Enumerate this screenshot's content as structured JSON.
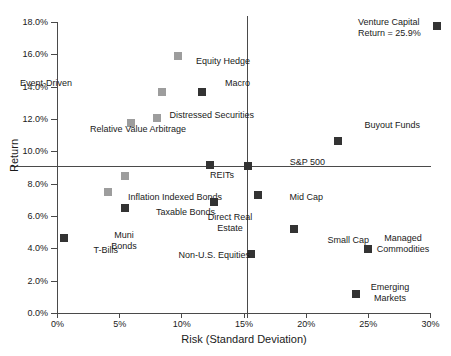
{
  "chart_data": {
    "type": "scatter",
    "title": "",
    "xlabel": "Risk (Standard Deviation)",
    "ylabel": "Return",
    "xlim": [
      0,
      30
    ],
    "ylim": [
      0,
      18
    ],
    "xticks": [
      "0%",
      "5%",
      "10%",
      "15%",
      "20%",
      "25%",
      "30%"
    ],
    "yticks": [
      "0.0%",
      "2.0%",
      "4.0%",
      "6.0%",
      "8.0%",
      "10.0%",
      "12.0%",
      "14.0%",
      "16.0%",
      "18.0%"
    ],
    "grid": false,
    "legend": "none",
    "reference_lines": {
      "horizontal_return": 9.1,
      "vertical_risk": 15.3,
      "anchor": "S&P 500"
    },
    "annotations": [
      {
        "text": "Return = 25.9%",
        "for": "Venture Capital"
      }
    ],
    "points": [
      {
        "label": "Venture Capital",
        "x": 30.5,
        "y": 17.8,
        "color": "dark",
        "label_pos": "left-stack"
      },
      {
        "label": "Equity Hedge",
        "x": 9.7,
        "y": 15.9,
        "color": "gray",
        "label_pos": "below"
      },
      {
        "label": "Event-Driven",
        "x": 8.4,
        "y": 13.7,
        "color": "gray",
        "label_pos": "left"
      },
      {
        "label": "Macro",
        "x": 11.6,
        "y": 13.7,
        "color": "dark",
        "label_pos": "right"
      },
      {
        "label": "Distressed Securities",
        "x": 8.0,
        "y": 12.1,
        "color": "gray",
        "label_pos": "right"
      },
      {
        "label": "Relative Value Arbitrage",
        "x": 5.9,
        "y": 11.8,
        "color": "gray",
        "label_pos": "below"
      },
      {
        "label": "REITs",
        "x": 12.3,
        "y": 9.2,
        "color": "dark",
        "label_pos": "below"
      },
      {
        "label": "S&P 500",
        "x": 15.3,
        "y": 9.1,
        "color": "dark",
        "label_pos": "right"
      },
      {
        "label": "Buyout Funds",
        "x": 22.6,
        "y": 10.7,
        "color": "dark",
        "label_pos": "above"
      },
      {
        "label": "Inflation Indexed Bonds",
        "x": 5.4,
        "y": 8.5,
        "color": "gray",
        "label_pos": "below-right"
      },
      {
        "label": "Taxable Bonds",
        "x": 4.1,
        "y": 7.5,
        "color": "gray",
        "label_pos": "right"
      },
      {
        "label": "Muni Bonds",
        "x": 5.4,
        "y": 6.5,
        "color": "dark",
        "label_pos": "below"
      },
      {
        "label": "Direct Real Estate",
        "x": 12.6,
        "y": 6.9,
        "color": "dark",
        "label_pos": "right-stack"
      },
      {
        "label": "Mid Cap",
        "x": 16.1,
        "y": 7.3,
        "color": "dark",
        "label_pos": "right"
      },
      {
        "label": "T-Bills",
        "x": 0.5,
        "y": 4.7,
        "color": "dark",
        "label_pos": "below-right"
      },
      {
        "label": "Small Cap",
        "x": 19.0,
        "y": 5.2,
        "color": "dark",
        "label_pos": "right"
      },
      {
        "label": "Non-U.S. Equities",
        "x": 15.6,
        "y": 3.7,
        "color": "dark",
        "label_pos": "left"
      },
      {
        "label": "Managed Commodities",
        "x": 25.0,
        "y": 4.0,
        "color": "dark",
        "label_pos": "above-stack"
      },
      {
        "label": "Emerging Markets",
        "x": 24.0,
        "y": 1.2,
        "color": "dark",
        "label_pos": "right-stack"
      }
    ]
  }
}
